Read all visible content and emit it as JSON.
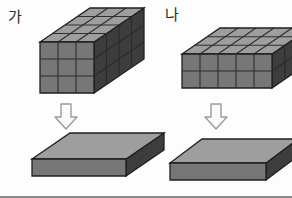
{
  "figure": {
    "title": "",
    "background_color": "#fdfdfd",
    "palette": {
      "top_face": "#9e9e9e",
      "front_face": "#777777",
      "side_face": "#3d3d3d",
      "edge_line": "#1f1f1f",
      "grid_line": "#2a2a2a",
      "arrow_fill": "#fbfbfb",
      "arrow_stroke": "#9a9a9a",
      "label_color": "#2b2b2b",
      "rule_color": "#8a8a8a"
    },
    "groups": [
      {
        "id": "group-ga",
        "label": "가",
        "label_x": 8,
        "label_y": 22,
        "solid": {
          "name": "rectangular-prism-ga",
          "columns": 3,
          "rows": 3,
          "depth": 4,
          "total_cubes": 36,
          "origin_x": 40,
          "origin_y": 93,
          "cell_w": 18,
          "cell_h": 17,
          "dx": 12.5,
          "dy": -8.5
        },
        "arrow": {
          "name": "down-arrow-ga",
          "x": 57,
          "y": 104,
          "width": 18,
          "height": 24,
          "glyph": "down-arrow-icon"
        },
        "slab": {
          "name": "flattened-slab-ga",
          "origin_x": 32,
          "origin_y": 176,
          "width": 94,
          "thickness": 17,
          "dx": 38,
          "dy": -26
        }
      },
      {
        "id": "group-na",
        "label": "나",
        "label_x": 165,
        "label_y": 20,
        "solid": {
          "name": "rectangular-prism-na",
          "columns": 5,
          "rows": 2,
          "depth": 3,
          "total_cubes": 30,
          "origin_x": 182,
          "origin_y": 88,
          "cell_w": 18,
          "cell_h": 17,
          "dx": 12.5,
          "dy": -8.5
        },
        "arrow": {
          "name": "down-arrow-na",
          "x": 207,
          "y": 104,
          "width": 18,
          "height": 24,
          "glyph": "down-arrow-icon"
        },
        "slab": {
          "name": "flattened-slab-na",
          "origin_x": 170,
          "origin_y": 180,
          "width": 96,
          "thickness": 17,
          "dx": 32,
          "dy": -24
        }
      }
    ]
  }
}
